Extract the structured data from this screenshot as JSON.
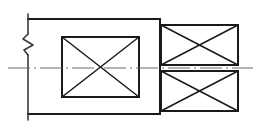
{
  "drawing": {
    "type": "engineering-section-view",
    "title": "",
    "canvas": {
      "width": 261,
      "height": 131,
      "background": "#ffffff"
    },
    "colors": {
      "outline": "#1a1a1a",
      "hatch": "#1a1a1a",
      "center_line": "#6b6b6b",
      "break_line": "#3a3a3a",
      "background": "#ffffff"
    },
    "elements": {
      "break_edge": {
        "name": "left-break-edge",
        "label": "",
        "x": 28,
        "y_top": 19,
        "y_bottom": 114,
        "break_symbol": "zigzag",
        "break_y_center": 42
      },
      "body_outline": {
        "name": "main-body-outline",
        "label": "",
        "x_left": 28,
        "x_right": 160,
        "y_top": 19,
        "y_bottom": 114,
        "open_left": true
      },
      "center_rect": {
        "name": "center-hatched-rectangle",
        "label": "",
        "x": 62,
        "y": 37,
        "width": 77,
        "height": 60,
        "hatch": "cross-diagonal"
      },
      "right_upper_rect": {
        "name": "right-upper-hatched-rectangle",
        "label": "",
        "x": 161,
        "y": 25,
        "width": 77,
        "height": 40,
        "hatch": "cross-diagonal"
      },
      "right_lower_rect": {
        "name": "right-lower-hatched-rectangle",
        "label": "",
        "x": 161,
        "y": 71,
        "width": 77,
        "height": 40,
        "hatch": "cross-diagonal"
      },
      "center_line": {
        "name": "horizontal-center-line",
        "label": "",
        "y": 68,
        "x_start": 8,
        "x_end": 253,
        "style": "dash-dot"
      }
    }
  }
}
